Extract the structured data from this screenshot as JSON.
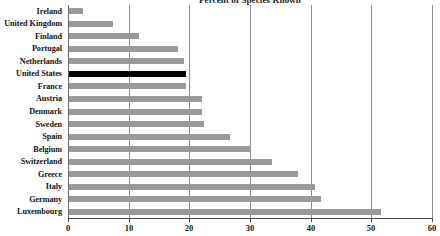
{
  "chart_data": {
    "type": "bar",
    "orientation": "horizontal",
    "title": "Percent of Species Known",
    "xlabel": "",
    "ylabel": "",
    "xlim": [
      0,
      60
    ],
    "xticks": [
      0,
      10,
      20,
      30,
      40,
      50,
      60
    ],
    "xtick_labels": [
      "0",
      "10",
      "20",
      "30",
      "40",
      "50",
      "60"
    ],
    "grid": true,
    "grid_axis": "x",
    "legend": false,
    "categories": [
      "Ireland",
      "United Kingdom",
      "Finland",
      "Portugal",
      "Netherlands",
      "United States",
      "France",
      "Austria",
      "Denmark",
      "Sweden",
      "Spain",
      "Belgium",
      "Switzerland",
      "Greece",
      "Italy",
      "Germany",
      "Luxembourg"
    ],
    "values": [
      2.3,
      7.2,
      11.5,
      18.0,
      19.0,
      19.3,
      19.3,
      22.0,
      22.0,
      22.2,
      26.5,
      30.0,
      33.5,
      37.7,
      40.5,
      41.5,
      51.5
    ],
    "highlight_category": "United States",
    "colors": {
      "bar": "#9a9a9a",
      "bar_highlight": "#000000",
      "gridline": "#8d8d8d",
      "axis": "#4a4a4a",
      "text": "#141414",
      "background": "#ffffff"
    }
  }
}
